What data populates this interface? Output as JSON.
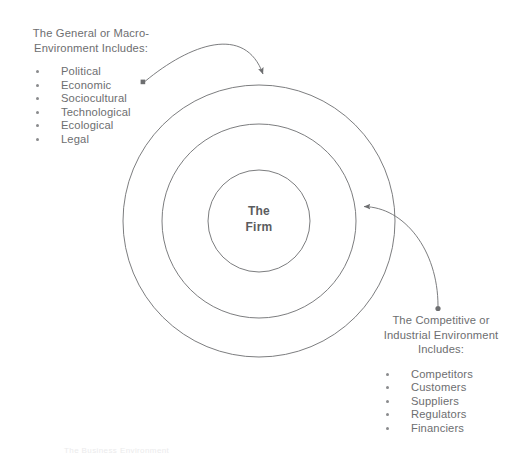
{
  "figure": {
    "caption": "The Business Environment",
    "background_color": "#ffffff",
    "line_color": "#6d6e70",
    "text_color": "#6d6e70",
    "core_text_color": "#5b5c5e"
  },
  "core": {
    "label": "The\nFirm"
  },
  "rings": {
    "outer": {
      "name": "general-macro-environment-ring",
      "cx": 259,
      "cy": 221,
      "r": 136
    },
    "middle": {
      "name": "competitive-industrial-environment-ring",
      "cx": 259,
      "cy": 221,
      "r": 97
    },
    "inner": {
      "name": "firm-core-ring",
      "cx": 259,
      "cy": 221,
      "r": 51
    }
  },
  "macro_environment": {
    "heading": "The General or Macro-\nEnvironment Includes:",
    "items": [
      "Political",
      "Economic",
      "Sociocultural",
      "Technological",
      "Ecological",
      "Legal"
    ]
  },
  "competitive_environment": {
    "heading": "The Competitive or\nIndustrial Environment\nIncludes:",
    "items": [
      "Competitors",
      "Customers",
      "Suppliers",
      "Regulators",
      "Financiers"
    ]
  },
  "connectors": {
    "macro": {
      "name": "macro-environment-connector",
      "start": {
        "x": 143,
        "y": 82
      },
      "end": {
        "x": 264,
        "y": 86
      },
      "marker": "arrowhead-down"
    },
    "competitive": {
      "name": "competitive-environment-connector",
      "start": {
        "x": 438,
        "y": 308
      },
      "end": {
        "x": 357,
        "y": 207
      },
      "marker": "arrowhead-left"
    }
  }
}
